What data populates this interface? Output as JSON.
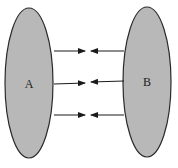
{
  "diagram": {
    "type": "set-mapping",
    "colors": {
      "set_fill": "#b8b8b8",
      "set_stroke": "#2a2a2a",
      "arrow": "#1a1a1a",
      "background": "#ffffff"
    },
    "sets": [
      {
        "id": "A",
        "label": "A",
        "cx": 29,
        "cy": 83,
        "rx": 24,
        "ry": 75,
        "label_x": 29,
        "label_y": 84
      },
      {
        "id": "B",
        "label": "B",
        "cx": 147,
        "cy": 82,
        "rx": 24,
        "ry": 75,
        "label_x": 147,
        "label_y": 82
      }
    ],
    "arrows": [
      {
        "from": "A",
        "to": "center",
        "x1": 54,
        "y1": 51,
        "x2": 85,
        "y2": 51
      },
      {
        "from": "B",
        "to": "center",
        "x1": 124,
        "y1": 51,
        "x2": 91,
        "y2": 51
      },
      {
        "from": "A",
        "to": "center",
        "x1": 54,
        "y1": 84,
        "x2": 85,
        "y2": 83
      },
      {
        "from": "B",
        "to": "center",
        "x1": 124,
        "y1": 81,
        "x2": 91,
        "y2": 82
      },
      {
        "from": "A",
        "to": "center",
        "x1": 54,
        "y1": 115,
        "x2": 85,
        "y2": 115
      },
      {
        "from": "B",
        "to": "center",
        "x1": 124,
        "y1": 115,
        "x2": 91,
        "y2": 115
      }
    ]
  }
}
